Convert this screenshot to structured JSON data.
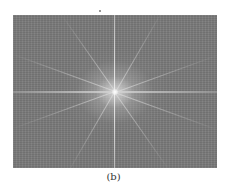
{
  "figure": {
    "caption": "(b)",
    "colors": {
      "background": "#7b7b7b",
      "bright_center": "#ffffff",
      "axis_lines": "#e0e0e0"
    },
    "rays_degrees": [
      20,
      55,
      120,
      160,
      200,
      235,
      300,
      340
    ]
  }
}
